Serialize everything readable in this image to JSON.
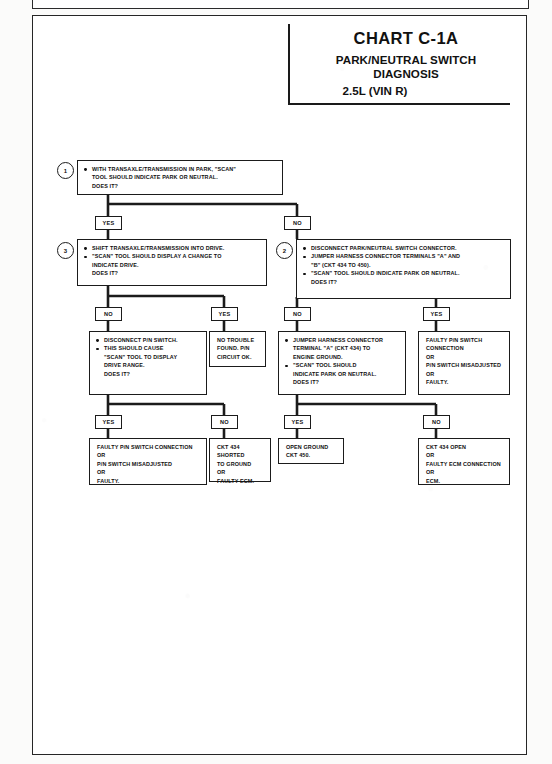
{
  "document": {
    "chart_id": "CHART C-1A",
    "title_line1": "PARK/NEUTRAL SWITCH DIAGNOSIS",
    "title_line2": "2.5L  (VIN R)"
  },
  "steps": [
    {
      "number": "1",
      "lines": [
        "WITH TRANSAXLE/TRANSMISSION IN PARK, \"SCAN\"",
        "TOOL SHOULD INDICATE PARK OR NEUTRAL.",
        "DOES IT?"
      ]
    },
    {
      "number": "3",
      "lines": [
        "SHIFT TRANSAXLE/TRANSMISSION  INTO DRIVE.",
        "\"SCAN\" TOOL SHOULD DISPLAY A CHANGE TO",
        "INDICATE DRIVE.",
        "DOES IT?"
      ]
    },
    {
      "number": "2",
      "lines": [
        "DISCONNECT PARK/NEUTRAL SWITCH CONNECTOR.",
        "JUMPER HARNESS CONNECTOR TERMINALS \"A\" AND",
        "\"B\" (CKT 434 TO 450).",
        "\"SCAN\" TOOL SHOULD INDICATE PARK OR NEUTRAL.",
        "DOES IT?"
      ]
    }
  ],
  "boxes": {
    "disconnect_pn_switch": {
      "l1": "DISCONNECT P/N SWITCH.",
      "l2": "THIS SHOULD CAUSE",
      "l3": "\"SCAN\" TOOL TO DISPLAY",
      "l4": "DRIVE RANGE.",
      "l5": "DOES IT?"
    },
    "no_trouble_found": {
      "l1": "NO TROUBLE",
      "l2": "FOUND.  P/N",
      "l3": "CIRCUIT OK."
    },
    "jumper_to_ground": {
      "l1": "JUMPER HARNESS CONNECTOR",
      "l2": "TERMINAL \"A\" (CKT 434) TO",
      "l3": "ENGINE GROUND.",
      "l4": "\"SCAN\" TOOL SHOULD",
      "l5": "INDICATE PARK OR NEUTRAL.",
      "l6": "DOES IT?"
    },
    "faulty_pn_connection_right": {
      "l1": "FAULTY P/N SWITCH",
      "l2": "CONNECTION",
      "l3": "OR",
      "l4": "P/N SWITCH MISADJUSTED",
      "l5": "OR",
      "l6": "FAULTY."
    },
    "faulty_pn_connection_left": {
      "l1": "FAULTY P/N SWITCH CONNECTION",
      "l2": "OR",
      "l3": "P/N SWITCH MISADJUSTED",
      "l4": "OR",
      "l5": "FAULTY."
    },
    "ckt434_shorted": {
      "l1": "CKT 434 SHORTED",
      "l2": "TO GROUND",
      "l3": "OR",
      "l4": "FAULTY ECM."
    },
    "open_ground": {
      "l1": "OPEN GROUND",
      "l2": "CKT 450."
    },
    "ckt434_open": {
      "l1": "CKT 434 OPEN",
      "l2": "OR",
      "l3": "FAULTY ECM CONNECTION",
      "l4": "OR",
      "l5": "ECM."
    }
  },
  "branch_labels": {
    "b1_yes": "YES",
    "b1_no": "NO",
    "b3_no": "NO",
    "b3_yes": "YES",
    "b2_no": "NO",
    "b2_yes": "YES",
    "b4_yes": "YES",
    "b4_no": "NO",
    "b5_yes": "YES",
    "b5_no": "NO"
  },
  "colors": {
    "ink": "#1b1b1b",
    "paper": "#ffffff"
  }
}
